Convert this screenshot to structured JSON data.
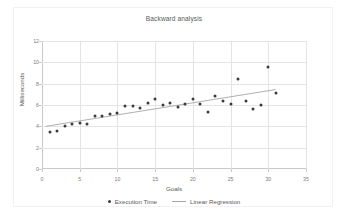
{
  "chart_data": {
    "type": "scatter",
    "title": "Backward analysis",
    "xlabel": "Goals",
    "ylabel": "Milliseconds",
    "xlim": [
      0,
      35
    ],
    "ylim": [
      0,
      12
    ],
    "xticks": [
      "0",
      "5",
      "10",
      "15",
      "20",
      "25",
      "30",
      "35"
    ],
    "yticks": [
      "0",
      "2",
      "4",
      "6",
      "8",
      "10",
      "12"
    ],
    "grid": true,
    "legend_position": "bottom",
    "series": [
      {
        "name": "Execution Time",
        "type": "scatter",
        "color": "#3b3b3b",
        "points": [
          [
            1,
            3.45
          ],
          [
            2,
            3.6
          ],
          [
            3,
            4.0
          ],
          [
            4,
            4.25
          ],
          [
            5,
            4.35
          ],
          [
            6,
            4.25
          ],
          [
            7,
            5.0
          ],
          [
            8,
            5.0
          ],
          [
            9,
            5.15
          ],
          [
            10,
            5.25
          ],
          [
            11,
            5.9
          ],
          [
            12,
            5.95
          ],
          [
            13,
            5.7
          ],
          [
            14,
            6.2
          ],
          [
            15,
            6.6
          ],
          [
            16,
            6.0
          ],
          [
            17,
            6.2
          ],
          [
            18,
            5.85
          ],
          [
            19,
            6.1
          ],
          [
            20,
            6.6
          ],
          [
            21,
            6.1
          ],
          [
            22,
            5.3
          ],
          [
            23,
            6.85
          ],
          [
            24,
            6.35
          ],
          [
            25,
            6.1
          ],
          [
            26,
            8.4
          ],
          [
            27,
            6.35
          ],
          [
            28,
            5.65
          ],
          [
            29,
            6.0
          ],
          [
            30,
            9.6
          ],
          [
            31,
            7.1
          ]
        ]
      },
      {
        "name": "Linear Regression",
        "type": "line",
        "color": "#a6a6a6",
        "points": [
          [
            0.5,
            4.0
          ],
          [
            31.0,
            7.45
          ]
        ]
      }
    ]
  },
  "legend": {
    "entries": [
      {
        "label": "Execution Time",
        "marker": "dot-marker-icon"
      },
      {
        "label": "Linear Regression",
        "marker": "line-marker-icon"
      }
    ]
  }
}
